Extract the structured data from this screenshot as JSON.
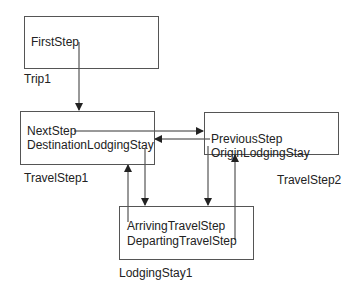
{
  "diagram": {
    "nodes": [
      {
        "id": "trip1",
        "label": "Trip1",
        "fields": [
          "FirstStep"
        ]
      },
      {
        "id": "travelstep1",
        "label": "TravelStep1",
        "fields": [
          "NextStep",
          "DestinationLodgingStay"
        ]
      },
      {
        "id": "travelstep2",
        "label": "TravelStep2",
        "fields": [
          "PreviousStep",
          "OriginLodgingStay"
        ]
      },
      {
        "id": "lodgingstay1",
        "label": "LodgingStay1",
        "fields": [
          "ArrivingTravelStep",
          "DepartingTravelStep"
        ]
      }
    ],
    "edges": [
      {
        "from": "trip1.FirstStep",
        "to": "travelstep1"
      },
      {
        "from": "travelstep1.NextStep",
        "to": "travelstep2"
      },
      {
        "from": "travelstep2.PreviousStep",
        "to": "travelstep1"
      },
      {
        "from": "travelstep1.DestinationLodgingStay",
        "to": "lodgingstay1"
      },
      {
        "from": "lodgingstay1.ArrivingTravelStep",
        "to": "travelstep1"
      },
      {
        "from": "travelstep2.OriginLodgingStay",
        "to": "lodgingstay1"
      },
      {
        "from": "lodgingstay1.DepartingTravelStep",
        "to": "travelstep2"
      }
    ],
    "colors": {
      "line": "#333333",
      "border": "#555555",
      "text": "#222222"
    }
  }
}
